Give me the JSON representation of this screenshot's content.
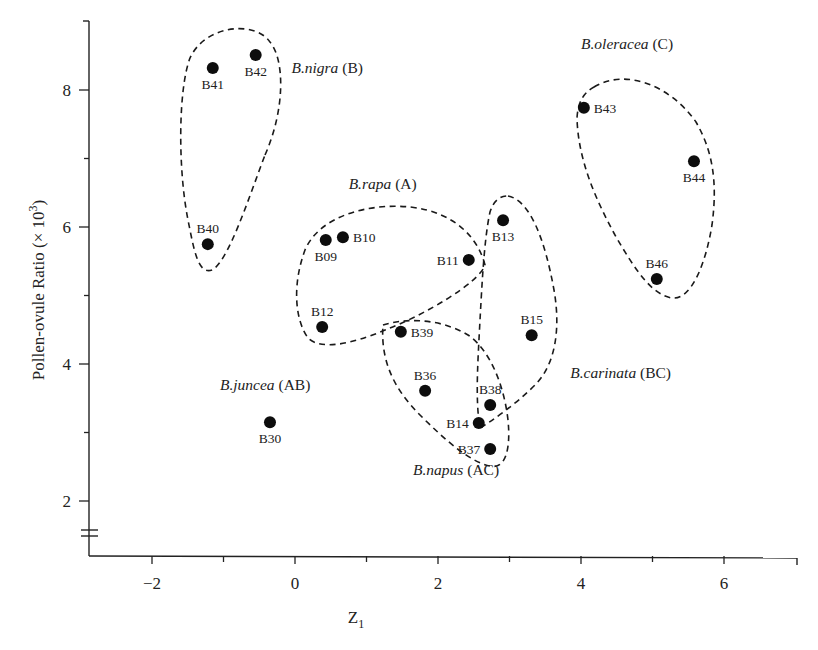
{
  "chart_data": {
    "type": "scatter",
    "title": "",
    "xlabel": "Z",
    "xlabel_subscript": "1",
    "ylabel": "Pollen-ovule Ratio (× 10",
    "ylabel_superscript": "3",
    "ylabel_suffix": ")",
    "xlim": [
      -3.0,
      7.0
    ],
    "ylim": [
      1.3,
      9.0
    ],
    "x_ticks": [
      -2,
      0,
      2,
      4,
      6
    ],
    "x_minor_ticks": [
      -1,
      1,
      3,
      5
    ],
    "y_ticks": [
      2,
      4,
      6,
      8
    ],
    "y_minor_ticks": [
      3,
      5,
      7
    ],
    "y_axis_break": true,
    "grid": false,
    "legend": "none (groups labeled inline)",
    "points": [
      {
        "label": "B41",
        "x": -1.15,
        "y": 8.32,
        "group": "B.nigra",
        "label_pos": "below"
      },
      {
        "label": "B42",
        "x": -0.55,
        "y": 8.51,
        "group": "B.nigra",
        "label_pos": "below"
      },
      {
        "label": "B40",
        "x": -1.22,
        "y": 5.75,
        "group": "B.nigra",
        "label_pos": "above"
      },
      {
        "label": "B09",
        "x": 0.43,
        "y": 5.81,
        "group": "B.rapa",
        "label_pos": "below"
      },
      {
        "label": "B10",
        "x": 0.67,
        "y": 5.85,
        "group": "B.rapa",
        "label_pos": "right"
      },
      {
        "label": "B11",
        "x": 2.43,
        "y": 5.52,
        "group": "B.rapa",
        "label_pos": "left"
      },
      {
        "label": "B12",
        "x": 0.38,
        "y": 4.54,
        "group": "B.rapa",
        "label_pos": "above"
      },
      {
        "label": "B13",
        "x": 2.91,
        "y": 6.1,
        "group": "B.carinata",
        "label_pos": "below"
      },
      {
        "label": "B15",
        "x": 3.31,
        "y": 4.42,
        "group": "B.carinata",
        "label_pos": "above"
      },
      {
        "label": "B14",
        "x": 2.57,
        "y": 3.14,
        "group": "B.carinata",
        "label_pos": "left"
      },
      {
        "label": "B39",
        "x": 1.48,
        "y": 4.47,
        "group": "B.napus",
        "label_pos": "right"
      },
      {
        "label": "B36",
        "x": 1.82,
        "y": 3.61,
        "group": "B.napus",
        "label_pos": "above"
      },
      {
        "label": "B38",
        "x": 2.73,
        "y": 3.4,
        "group": "B.napus",
        "label_pos": "above"
      },
      {
        "label": "B37",
        "x": 2.73,
        "y": 2.76,
        "group": "B.napus",
        "label_pos": "left"
      },
      {
        "label": "B30",
        "x": -0.35,
        "y": 3.15,
        "group": "B.juncea",
        "label_pos": "below"
      },
      {
        "label": "B43",
        "x": 4.04,
        "y": 7.74,
        "group": "B.oleracea",
        "label_pos": "right"
      },
      {
        "label": "B44",
        "x": 5.58,
        "y": 6.96,
        "group": "B.oleracea",
        "label_pos": "below"
      },
      {
        "label": "B46",
        "x": 5.06,
        "y": 5.24,
        "group": "B.oleracea",
        "label_pos": "above"
      }
    ],
    "groups": [
      {
        "name": "B.nigra",
        "genome": "(B)",
        "label_x": -0.05,
        "label_y": 8.25,
        "members": [
          "B40",
          "B41",
          "B42"
        ]
      },
      {
        "name": "B.rapa",
        "genome": "(A)",
        "label_x": 0.75,
        "label_y": 6.55,
        "members": [
          "B09",
          "B10",
          "B11",
          "B12"
        ]
      },
      {
        "name": "B.oleracea",
        "genome": "(C)",
        "label_x": 4.0,
        "label_y": 8.6,
        "members": [
          "B43",
          "B44",
          "B46"
        ]
      },
      {
        "name": "B.carinata",
        "genome": "(BC)",
        "label_x": 3.85,
        "label_y": 3.8,
        "members": [
          "B13",
          "B15",
          "B14"
        ]
      },
      {
        "name": "B.juncea",
        "genome": "(AB)",
        "label_x": -1.05,
        "label_y": 3.62,
        "members": [
          "B30"
        ]
      },
      {
        "name": "B.napus",
        "genome": "(AC)",
        "label_x": 1.65,
        "label_y": 2.38,
        "members": [
          "B39",
          "B36",
          "B38",
          "B37"
        ]
      }
    ]
  },
  "hull_paths": {
    "B.nigra": "M 265,155 C 285,110 285,60 270,42 C 255,20 205,25 190,58 C 178,90 178,170 188,220 C 194,250 198,275 212,270 C 228,262 248,200 265,155 Z",
    "B.rapa": "M 485,265 C 478,238 455,212 410,207 C 370,203 320,215 305,250 C 292,285 295,320 308,338 C 320,350 350,345 385,330 C 425,315 480,282 485,265 Z",
    "B.oleracea": "M 594,87 C 625,68 670,85 696,122 C 712,150 718,180 712,225 C 706,262 692,300 672,298 C 652,295 635,270 615,235 C 596,200 578,160 577,118 C 578,100 585,92 594,87 Z",
    "B.carinata": "M 508,196 C 530,200 545,240 554,290 C 561,330 555,365 535,385 C 515,405 493,420 480,428 C 475,400 478,360 480,320 C 482,285 484,240 490,212 C 494,200 500,196 508,196 Z",
    "B.napus": "M 383,325 C 405,318 440,318 468,335 C 490,350 504,385 508,420 C 511,450 505,470 490,466 C 470,462 445,440 420,415 C 398,393 380,365 383,325 Z"
  }
}
